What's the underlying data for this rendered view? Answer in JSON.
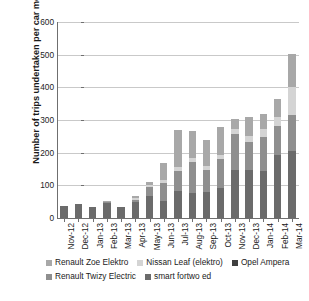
{
  "chart_data": {
    "type": "bar",
    "stacked": true,
    "title": "",
    "xlabel": "",
    "ylabel": "Number of trips undertaken per car model",
    "ylim": [
      0,
      600
    ],
    "ytick_values": [
      0,
      100,
      200,
      300,
      400,
      500,
      600
    ],
    "ytick_labels": [
      "0",
      "100",
      "200",
      "300",
      "400",
      "500",
      "600"
    ],
    "grid": true,
    "legend_position": "bottom",
    "categories": [
      "Nov-12",
      "Dec-12",
      "Jan-13",
      "Feb-13",
      "Mar-13",
      "Apr-13",
      "May-13",
      "Jun-13",
      "Jul-13",
      "Aug-13",
      "Sep-13",
      "Oct-13",
      "Nov-13",
      "Dec-13",
      "Jan-14",
      "Feb-14",
      "Mar-14"
    ],
    "series": [
      {
        "name": "smart fortwo ed",
        "color": "#6b6b6b",
        "values": [
          38,
          42,
          34,
          45,
          34,
          48,
          67,
          52,
          82,
          77,
          79,
          93,
          148,
          148,
          143,
          194,
          206
        ]
      },
      {
        "name": "Opel Ampera",
        "color": "#3f3f3f",
        "values": [
          0,
          0,
          0,
          0,
          0,
          0,
          0,
          0,
          0,
          0,
          0,
          0,
          0,
          0,
          0,
          0,
          0
        ]
      },
      {
        "name": "Renault Twizy Electric",
        "color": "#8f8f8f",
        "values": [
          0,
          0,
          0,
          4,
          0,
          6,
          27,
          55,
          63,
          96,
          68,
          87,
          110,
          84,
          106,
          89,
          110
        ]
      },
      {
        "name": "Nissan Leaf (elektro)",
        "color": "#d4d4d4",
        "values": [
          0,
          0,
          0,
          0,
          0,
          7,
          8,
          9,
          11,
          12,
          13,
          14,
          14,
          20,
          24,
          26,
          85
        ]
      },
      {
        "name": "Renault Zoe Elektro",
        "color": "#a8a8a8",
        "values": [
          0,
          0,
          0,
          4,
          0,
          6,
          8,
          52,
          113,
          81,
          79,
          86,
          32,
          58,
          45,
          56,
          100
        ]
      }
    ],
    "stack_order_bottom_to_top": [
      "smart fortwo ed",
      "Renault Twizy Electric",
      "Nissan Leaf (elektro)",
      "Renault Zoe Elektro"
    ],
    "stack_totals": [
      38,
      42,
      34,
      53,
      34,
      67,
      110,
      168,
      269,
      266,
      239,
      280,
      304,
      310,
      318,
      365,
      501
    ],
    "legend": [
      {
        "label": "Renault Zoe Elektro",
        "color": "#a8a8a8"
      },
      {
        "label": "Nissan Leaf (elektro)",
        "color": "#d4d4d4"
      },
      {
        "label": "Opel Ampera",
        "color": "#3f3f3f"
      },
      {
        "label": "Renault Twizy Electric",
        "color": "#8f8f8f"
      },
      {
        "label": "smart fortwo ed",
        "color": "#6b6b6b"
      }
    ]
  }
}
